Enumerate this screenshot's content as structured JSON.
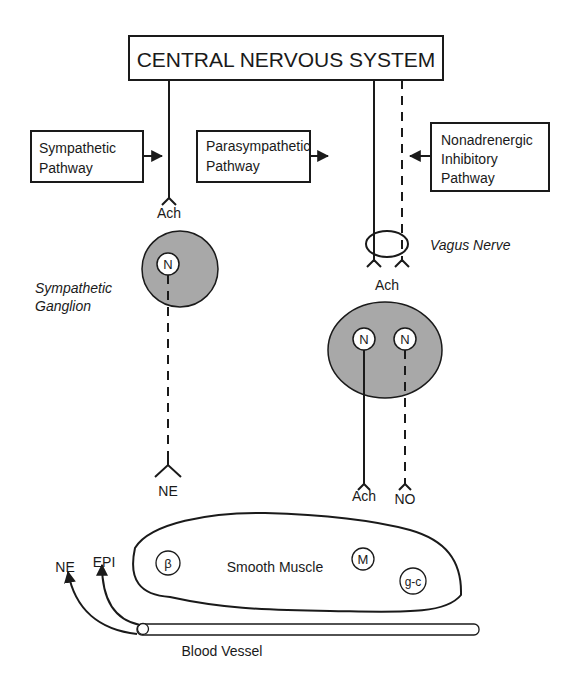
{
  "diagram": {
    "title": "CENTRAL NERVOUS SYSTEM",
    "pathways": {
      "sympathetic": [
        "Sympathetic",
        "Pathway"
      ],
      "parasympathetic": [
        "Parasympathetic",
        "Pathway"
      ],
      "nonadrenergic": [
        "Nonadrenergic",
        "Inhibitory",
        "Pathway"
      ]
    },
    "labels": {
      "ach_sympathetic": "Ach",
      "vagus_nerve": "Vagus Nerve",
      "ach_vagus": "Ach",
      "sympathetic_ganglion": [
        "Sympathetic",
        "Ganglion"
      ],
      "neuron_symbol": "N",
      "ne_terminal": "NE",
      "ach_terminal": "Ach",
      "no_terminal": "NO",
      "smooth_muscle": "Smooth Muscle",
      "beta_receptor": "β",
      "muscarinic_receptor": "M",
      "guanylyl_cyclase": "g-c",
      "ne_circulating": "NE",
      "epi_circulating": "EPI",
      "blood_vessel": "Blood Vessel"
    },
    "colors": {
      "ink": "#1a1a1a",
      "ganglion_fill": "#a8a8a8",
      "background": "#ffffff"
    }
  }
}
